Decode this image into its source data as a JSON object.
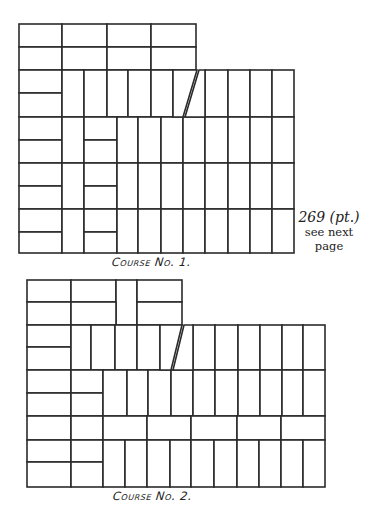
{
  "diagram": {
    "stroke_color": "#2b2b2b",
    "background": "#ffffff"
  },
  "course1": {
    "label": "Course No. 1.",
    "bricks": [
      [
        19,
        24,
        43,
        23
      ],
      [
        62,
        24,
        45,
        23
      ],
      [
        107,
        24,
        44,
        23
      ],
      [
        151,
        24,
        45,
        23
      ],
      [
        19,
        47,
        43,
        23
      ],
      [
        62,
        47,
        45,
        23
      ],
      [
        107,
        47,
        44,
        23
      ],
      [
        151,
        47,
        45,
        23
      ],
      [
        19,
        70,
        43,
        23
      ],
      [
        19,
        93,
        43,
        24
      ],
      [
        62,
        70,
        22,
        47
      ],
      [
        84,
        70,
        23,
        47
      ],
      [
        107,
        70,
        21,
        47
      ],
      [
        128,
        70,
        23,
        47
      ],
      [
        151,
        70,
        22,
        47
      ],
      [
        205,
        70,
        23,
        47
      ],
      [
        228,
        70,
        22,
        47
      ],
      [
        250,
        70,
        22,
        47
      ],
      [
        272,
        70,
        22,
        47
      ],
      [
        19,
        117,
        43,
        23
      ],
      [
        19,
        140,
        43,
        23
      ],
      [
        19,
        163,
        43,
        23
      ],
      [
        19,
        186,
        43,
        23
      ],
      [
        19,
        209,
        43,
        23
      ],
      [
        19,
        232,
        43,
        21
      ],
      [
        62,
        117,
        22,
        46
      ],
      [
        62,
        163,
        22,
        46
      ],
      [
        62,
        209,
        22,
        44
      ],
      [
        84,
        117,
        33,
        23
      ],
      [
        84,
        140,
        33,
        23
      ],
      [
        84,
        163,
        33,
        23
      ],
      [
        84,
        186,
        33,
        23
      ],
      [
        84,
        209,
        33,
        23
      ],
      [
        84,
        232,
        33,
        21
      ],
      [
        117,
        117,
        21,
        46
      ],
      [
        138,
        117,
        23,
        46
      ],
      [
        161,
        117,
        22,
        46
      ],
      [
        183,
        117,
        22,
        46
      ],
      [
        205,
        117,
        23,
        46
      ],
      [
        228,
        117,
        22,
        46
      ],
      [
        250,
        117,
        22,
        46
      ],
      [
        272,
        117,
        22,
        46
      ],
      [
        117,
        163,
        21,
        46
      ],
      [
        138,
        163,
        23,
        46
      ],
      [
        161,
        163,
        22,
        46
      ],
      [
        183,
        163,
        22,
        46
      ],
      [
        205,
        163,
        23,
        46
      ],
      [
        228,
        163,
        22,
        46
      ],
      [
        250,
        163,
        22,
        46
      ],
      [
        272,
        163,
        22,
        46
      ],
      [
        117,
        209,
        21,
        44
      ],
      [
        138,
        209,
        23,
        44
      ],
      [
        161,
        209,
        22,
        44
      ],
      [
        183,
        209,
        22,
        44
      ],
      [
        205,
        209,
        23,
        44
      ],
      [
        228,
        209,
        22,
        44
      ],
      [
        250,
        209,
        22,
        44
      ],
      [
        272,
        209,
        22,
        44
      ]
    ],
    "slant": {
      "x1": 173,
      "y1": 70,
      "x2": 205,
      "y2": 70,
      "bx1": 173,
      "by1": 117,
      "bx2": 205,
      "by2": 117,
      "sx_top": 197,
      "sx_bottom": 183
    }
  },
  "course2": {
    "label": "Course No. 2.",
    "bricks": [
      [
        27,
        280,
        44,
        22
      ],
      [
        71,
        280,
        45,
        22
      ],
      [
        116,
        280,
        21,
        45
      ],
      [
        137,
        280,
        45,
        22
      ],
      [
        27,
        302,
        44,
        23
      ],
      [
        71,
        302,
        45,
        23
      ],
      [
        137,
        302,
        45,
        23
      ],
      [
        27,
        325,
        44,
        22
      ],
      [
        27,
        347,
        44,
        23
      ],
      [
        71,
        325,
        20,
        45
      ],
      [
        91,
        325,
        24,
        45
      ],
      [
        115,
        325,
        22,
        45
      ],
      [
        137,
        325,
        23,
        45
      ],
      [
        193,
        325,
        22,
        45
      ],
      [
        215,
        325,
        23,
        45
      ],
      [
        238,
        325,
        22,
        45
      ],
      [
        260,
        325,
        22,
        45
      ],
      [
        282,
        325,
        21,
        45
      ],
      [
        303,
        325,
        22,
        45
      ],
      [
        27,
        370,
        44,
        23
      ],
      [
        27,
        393,
        44,
        23
      ],
      [
        71,
        370,
        32,
        23
      ],
      [
        71,
        393,
        32,
        23
      ],
      [
        103,
        370,
        24,
        46
      ],
      [
        127,
        370,
        21,
        46
      ],
      [
        148,
        370,
        23,
        46
      ],
      [
        171,
        370,
        22,
        46
      ],
      [
        193,
        370,
        22,
        46
      ],
      [
        215,
        370,
        23,
        46
      ],
      [
        238,
        370,
        22,
        46
      ],
      [
        260,
        370,
        22,
        46
      ],
      [
        282,
        370,
        21,
        46
      ],
      [
        303,
        370,
        22,
        46
      ],
      [
        27,
        416,
        44,
        24
      ],
      [
        71,
        416,
        32,
        24
      ],
      [
        103,
        416,
        44,
        24
      ],
      [
        147,
        416,
        44,
        24
      ],
      [
        191,
        416,
        46,
        24
      ],
      [
        237,
        416,
        44,
        24
      ],
      [
        281,
        416,
        44,
        24
      ],
      [
        27,
        440,
        44,
        22
      ],
      [
        27,
        462,
        44,
        25
      ],
      [
        71,
        440,
        32,
        22
      ],
      [
        71,
        462,
        32,
        25
      ],
      [
        103,
        440,
        22,
        47
      ],
      [
        125,
        440,
        22,
        47
      ],
      [
        147,
        440,
        23,
        47
      ],
      [
        170,
        440,
        21,
        47
      ],
      [
        191,
        440,
        23,
        47
      ],
      [
        214,
        440,
        23,
        47
      ],
      [
        237,
        440,
        22,
        47
      ],
      [
        259,
        440,
        22,
        47
      ],
      [
        281,
        440,
        22,
        47
      ],
      [
        303,
        440,
        22,
        47
      ]
    ],
    "slant": {
      "left": 160,
      "right": 193,
      "top": 325,
      "bottom": 370,
      "sx_top": 182,
      "sx_bottom": 171
    }
  },
  "page_note": {
    "number": "269 (pt.)",
    "line1": "see next",
    "line2": "page"
  }
}
